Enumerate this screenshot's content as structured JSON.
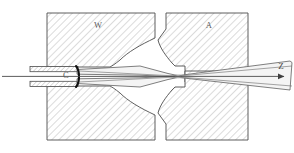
{
  "figure": {
    "type": "cross-section-schematic",
    "background_color": "#ffffff",
    "line_color": "#4d4d4d",
    "hatch_color": "#b8b8b8",
    "beam_fill": "#f2f2f2",
    "emphasis_color": "#1a1a1a"
  },
  "labels": {
    "wehnelt": "W",
    "anode": "A",
    "cathode": "C",
    "axis": "Z"
  },
  "components": [
    {
      "name": "wehnelt-cylinder-upper",
      "label": "W",
      "role": "grid electrode, upper half, hatched block with concave aperture throat"
    },
    {
      "name": "wehnelt-cylinder-lower",
      "label": "W",
      "role": "grid electrode, lower half, mirror of upper block"
    },
    {
      "name": "anode-upper",
      "label": "A",
      "role": "accelerating electrode, upper half, hatched block with rectangular bore"
    },
    {
      "name": "anode-lower",
      "label": "A",
      "role": "accelerating electrode, lower half"
    },
    {
      "name": "cathode",
      "label": "C",
      "role": "emitting curved filament tip at left, heavy dark arc"
    },
    {
      "name": "cathode-support-upper",
      "role": "hatched lead/insulator strip entering from left, above axis"
    },
    {
      "name": "cathode-support-lower",
      "role": "hatched lead/insulator strip entering from left, below axis"
    },
    {
      "name": "electron-beam-envelope",
      "role": "beam diverging from cathode, converging to crossover in anode bore, then diverging to the right"
    },
    {
      "name": "optical-axis",
      "label": "Z",
      "role": "horizontal axis of symmetry terminating in an arrowhead at right"
    }
  ],
  "geometry": {
    "width": 294,
    "height": 153,
    "axis_y": 76,
    "crossover_x": 178,
    "cathode_x": 76,
    "hatch_angle_deg": 45
  }
}
